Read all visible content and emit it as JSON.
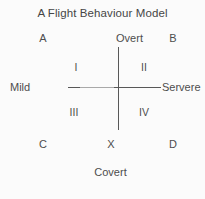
{
  "figure": {
    "title": "A Flight Behaviour Model",
    "background_color": "#fbfbfb",
    "ink_color": "#4d4d4d",
    "axis_color": "#585858"
  },
  "axes": {
    "vertical": {
      "top_label": "Overt",
      "bottom_label": "Covert"
    },
    "horizontal": {
      "left_label": "Mild",
      "right_label": "Servere"
    }
  },
  "corners": [
    {
      "key": "a",
      "label": "A"
    },
    {
      "key": "b",
      "label": "B"
    },
    {
      "key": "c",
      "label": "C"
    },
    {
      "key": "x",
      "label": "X"
    },
    {
      "key": "d",
      "label": "D"
    }
  ],
  "quadrants": [
    {
      "key": "1",
      "label": "I"
    },
    {
      "key": "2",
      "label": "II"
    },
    {
      "key": "3",
      "label": "III"
    },
    {
      "key": "4",
      "label": "IV"
    }
  ]
}
